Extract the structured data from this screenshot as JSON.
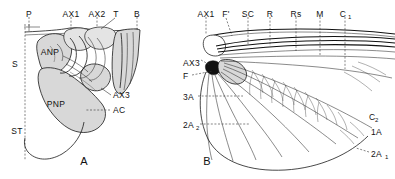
{
  "figure": {
    "background_color": "#ffffff",
    "ink_color": "#1a1a1a",
    "shade_color": "#d8d8d8",
    "width": 395,
    "height": 179
  },
  "panels": [
    {
      "id": "A",
      "letter": "A",
      "caption": "Wing base sclerites, lateral view",
      "labels": [
        {
          "key": "P",
          "text": "P",
          "x": 29,
          "y": 14,
          "anchor": "middle",
          "leader": "vertical-dashed"
        },
        {
          "key": "AX1",
          "text": "AX1",
          "x": 71,
          "y": 14,
          "anchor": "middle",
          "leader": "vertical-dashed"
        },
        {
          "key": "AX2",
          "text": "AX2",
          "x": 97,
          "y": 14,
          "anchor": "middle",
          "leader": "vertical-dashed"
        },
        {
          "key": "T",
          "text": "T",
          "x": 116,
          "y": 14,
          "anchor": "middle",
          "leader": "diagonal-solid"
        },
        {
          "key": "B",
          "text": "B",
          "x": 137,
          "y": 14,
          "anchor": "middle",
          "leader": "vertical-dashed"
        },
        {
          "key": "S",
          "text": "S",
          "x": 15,
          "y": 64,
          "anchor": "middle",
          "leader": "none"
        },
        {
          "key": "ST",
          "text": "ST",
          "x": 16,
          "y": 131,
          "anchor": "middle",
          "leader": "none"
        },
        {
          "key": "ANP",
          "text": "ANP",
          "x": 50,
          "y": 52,
          "anchor": "middle",
          "leader": "none"
        },
        {
          "key": "PNP",
          "text": "PNP",
          "x": 56,
          "y": 104,
          "anchor": "middle",
          "leader": "none"
        },
        {
          "key": "AX3",
          "text": "AX3",
          "x": 113,
          "y": 97,
          "anchor": "start",
          "leader": "solid"
        },
        {
          "key": "AC",
          "text": "AC",
          "x": 113,
          "y": 113,
          "anchor": "start",
          "leader": "dashed"
        }
      ]
    },
    {
      "id": "B",
      "letter": "B",
      "caption": "Wing venation, dorsal view",
      "labels": [
        {
          "key": "AX1",
          "text": "AX1",
          "x": 206,
          "y": 14,
          "anchor": "middle",
          "leader": "vertical-dashed"
        },
        {
          "key": "F'",
          "text": "F'",
          "x": 226,
          "y": 14,
          "anchor": "middle",
          "leader": "diagonal-dashed"
        },
        {
          "key": "SC",
          "text": "SC",
          "x": 248,
          "y": 14,
          "anchor": "middle",
          "leader": "vertical-dashed"
        },
        {
          "key": "R",
          "text": "R",
          "x": 270,
          "y": 14,
          "anchor": "middle",
          "leader": "vertical-dashed"
        },
        {
          "key": "Rs",
          "text": "Rs",
          "x": 296,
          "y": 14,
          "anchor": "middle",
          "leader": "vertical-dashed"
        },
        {
          "key": "M",
          "text": "M",
          "x": 320,
          "y": 14,
          "anchor": "middle",
          "leader": "vertical-dashed"
        },
        {
          "key": "C1",
          "text": "C",
          "sub": "1",
          "x": 345,
          "y": 14,
          "anchor": "middle",
          "leader": "vertical-dashed"
        },
        {
          "key": "AX3",
          "text": "AX3",
          "x": 183,
          "y": 63,
          "anchor": "start",
          "leader": "dashed"
        },
        {
          "key": "F",
          "text": "F",
          "x": 183,
          "y": 77,
          "anchor": "start",
          "leader": "dashed"
        },
        {
          "key": "3A",
          "text": "3A",
          "x": 183,
          "y": 99,
          "anchor": "start",
          "leader": "dashed"
        },
        {
          "key": "2A2",
          "text": "2A",
          "sub": "2",
          "x": 183,
          "y": 127,
          "anchor": "start",
          "leader": "dashed"
        },
        {
          "key": "C2",
          "text": "C",
          "sub": "2",
          "x": 369,
          "y": 118,
          "anchor": "start",
          "leader": "none"
        },
        {
          "key": "1A",
          "text": "1A",
          "x": 371,
          "y": 133,
          "anchor": "start",
          "leader": "none"
        },
        {
          "key": "2A1",
          "text": "2A",
          "sub": "1",
          "x": 371,
          "y": 155,
          "anchor": "start",
          "leader": "dashed"
        }
      ]
    }
  ]
}
